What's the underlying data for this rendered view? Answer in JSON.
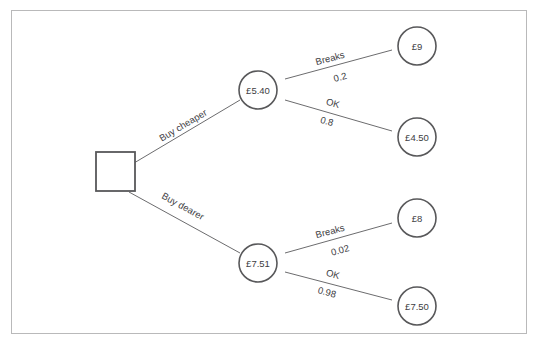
{
  "diagram": {
    "type": "decision-tree",
    "decision_node": {
      "shape": "square",
      "label": ""
    },
    "chance_nodes": [
      {
        "id": "cheaper",
        "label": "£5.40"
      },
      {
        "id": "dearer",
        "label": "£7.51"
      }
    ],
    "decision_branches": [
      {
        "id": "buy-cheaper",
        "label": "Buy cheaper"
      },
      {
        "id": "buy-dearer",
        "label": "Buy dearer"
      }
    ],
    "outcome_branches": [
      {
        "id": "cheaper-breaks",
        "label": "Breaks",
        "probability": "0.2"
      },
      {
        "id": "cheaper-ok",
        "label": "OK",
        "probability": "0.8"
      },
      {
        "id": "dearer-breaks",
        "label": "Breaks",
        "probability": "0.02"
      },
      {
        "id": "dearer-ok",
        "label": "OK",
        "probability": "0.98"
      }
    ],
    "outcome_nodes": [
      {
        "id": "cheaper-breaks-value",
        "label": "£9"
      },
      {
        "id": "cheaper-ok-value",
        "label": "£4.50"
      },
      {
        "id": "dearer-breaks-value",
        "label": "£8"
      },
      {
        "id": "dearer-ok-value",
        "label": "£7.50"
      }
    ],
    "colors": {
      "frame": "#b9b9ba",
      "node_stroke": "#58585a",
      "edge_stroke": "#6c6c6e",
      "text": "#3d3d3f",
      "background": "#ffffff"
    }
  }
}
